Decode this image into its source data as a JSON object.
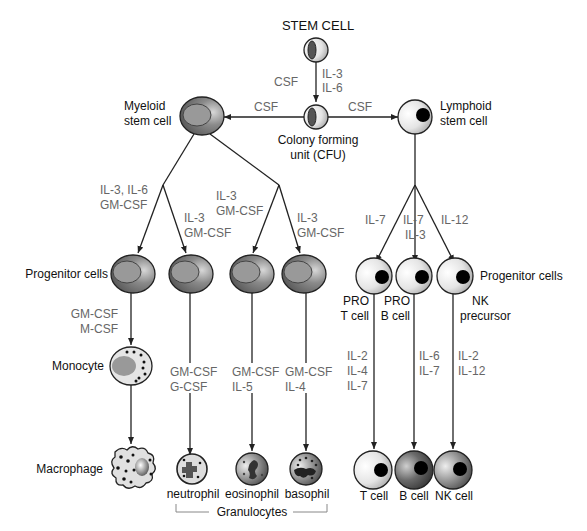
{
  "title": "STEM CELL",
  "cfu": {
    "line1": "Colony forming",
    "line2": "unit (CFU)"
  },
  "stem_to_cfu": {
    "left": "CSF",
    "right1": "IL-3",
    "right2": "IL-6"
  },
  "cfu_to_myeloid": "CSF",
  "cfu_to_lymphoid": "CSF",
  "myeloid": {
    "line1": "Myeloid",
    "line2": "stem cell"
  },
  "lymphoid": {
    "line1": "Lymphoid",
    "line2": "stem cell"
  },
  "myeloid_branches": [
    {
      "line1": "IL-3, IL-6",
      "line2": "GM-CSF"
    },
    {
      "line1": "IL-3",
      "line2": "GM-CSF"
    },
    {
      "line1": "IL-3",
      "line2": "GM-CSF"
    },
    {
      "line1": "IL-3",
      "line2": "GM-CSF"
    }
  ],
  "lymphoid_branches": [
    {
      "line1": "IL-7",
      "line2": ""
    },
    {
      "line1": "IL-7",
      "line2": "IL-3"
    },
    {
      "line1": "IL-12",
      "line2": ""
    }
  ],
  "progenitor_left": "Progenitor cells",
  "progenitor_right": "Progenitor cells",
  "lymphoid_progenitors": [
    {
      "line1": "PRO",
      "line2": "T cell"
    },
    {
      "line1": "PRO",
      "line2": "B cell"
    },
    {
      "line1": "NK",
      "line2": "precursor"
    }
  ],
  "mono_factors": {
    "line1": "GM-CSF",
    "line2": "M-CSF"
  },
  "monocyte": "Monocyte",
  "macrophage": "Macrophage",
  "granulocyte_factors": [
    {
      "line1": "GM-CSF",
      "line2": "G-CSF"
    },
    {
      "line1": "GM-CSF",
      "line2": "IL-5"
    },
    {
      "line1": "GM-CSF",
      "line2": "IL-4"
    }
  ],
  "granulocyte_names": [
    "neutrophil",
    "eosinophil",
    "basophil"
  ],
  "granulocytes_group": "Granulocytes",
  "lymph_factors": [
    {
      "lines": [
        "IL-2",
        "IL-4",
        "IL-7"
      ]
    },
    {
      "lines": [
        "IL-6",
        "IL-7"
      ]
    },
    {
      "lines": [
        "IL-2",
        "IL-12"
      ]
    }
  ],
  "lymph_names": [
    "T cell",
    "B cell",
    "NK cell"
  ]
}
